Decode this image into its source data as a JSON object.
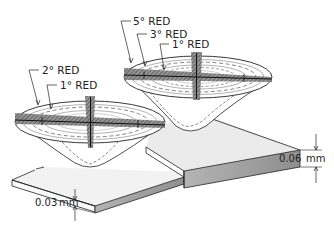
{
  "diagram": {
    "type": "technical-illustration",
    "left_lens": {
      "labels": [
        {
          "text": "2° RED",
          "ring": "outer"
        },
        {
          "text": "1° RED",
          "ring": "inner"
        }
      ]
    },
    "right_lens": {
      "labels": [
        {
          "text": "5° RED",
          "ring": "outer"
        },
        {
          "text": "3° RED",
          "ring": "middle"
        },
        {
          "text": "1° RED",
          "ring": "inner"
        }
      ]
    },
    "dimensions": {
      "thin_slab": {
        "value": "0.03",
        "unit": "mm"
      },
      "thick_slab": {
        "value": "0.06",
        "unit": "mm"
      }
    },
    "colors": {
      "line": "#222222",
      "slab_top": "#efefef",
      "slab_side": "#9a9a9a",
      "hatch": "#555555",
      "background": "#ffffff"
    }
  }
}
